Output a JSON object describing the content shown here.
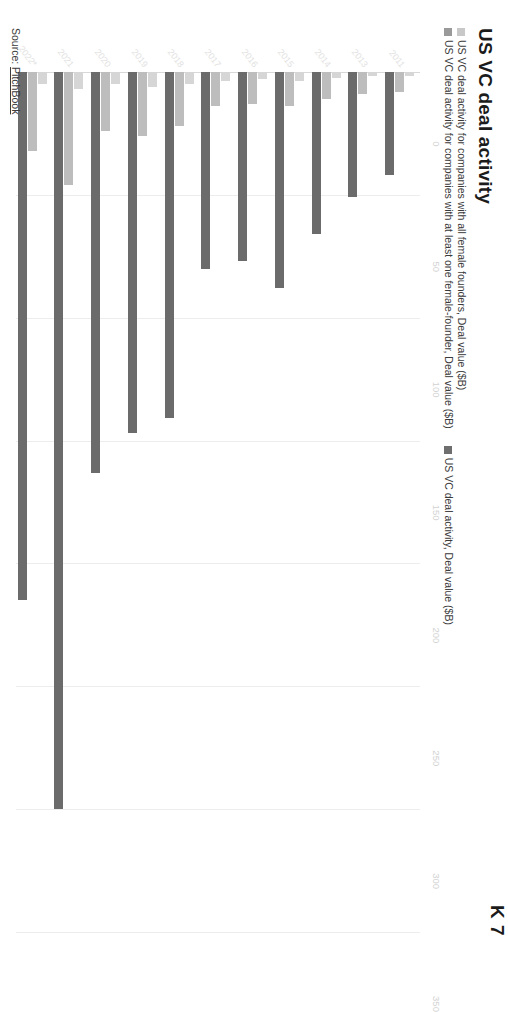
{
  "cropped_header": "K 7",
  "chart": {
    "title": "US VC deal activity",
    "source_prefix": "Source:",
    "source_name": "PitchBook"
  },
  "legend": {
    "items": [
      {
        "label": "US VC deal activity for companies with all female founders, Deal value ($B)",
        "color": "#c8c8c8"
      },
      {
        "label": "US VC deal activity for companies with at least one female-founder, Deal value ($B)",
        "color": "#9a9a9a"
      },
      {
        "label": "US VC deal activity, Deal value ($B)",
        "color": "#6e6e6e"
      }
    ]
  },
  "chart_data": {
    "type": "bar",
    "title": "US VC deal activity",
    "orientation": "horizontal",
    "xlabel": "Deal value ($B)",
    "ylabel": "",
    "xlim": [
      0,
      350
    ],
    "xticks": [
      0,
      50,
      100,
      150,
      200,
      250,
      300,
      350
    ],
    "grid": true,
    "legend_position": "top",
    "categories": [
      "2011",
      "2013",
      "2014",
      "2015",
      "2016",
      "2017",
      "2018",
      "2019",
      "2020",
      "2021",
      "2022*"
    ],
    "series": [
      {
        "name": "US VC deal activity for companies with all female founders, Deal value ($B)",
        "color": "#d6d6d6",
        "values": [
          1.5,
          1.5,
          2.5,
          3.5,
          3,
          3.5,
          5,
          6,
          5,
          7,
          5
        ]
      },
      {
        "name": "US VC deal activity for companies with at least one female-founder, Deal value ($B)",
        "color": "#bdbdbd",
        "values": [
          8,
          9,
          11,
          14,
          13,
          14,
          22,
          26,
          24,
          46,
          32
        ]
      },
      {
        "name": "US VC deal activity, Deal value ($B)",
        "color": "#6b6b6b",
        "values": [
          42,
          51,
          66,
          88,
          77,
          80,
          141,
          147,
          163,
          300,
          215
        ]
      }
    ]
  }
}
